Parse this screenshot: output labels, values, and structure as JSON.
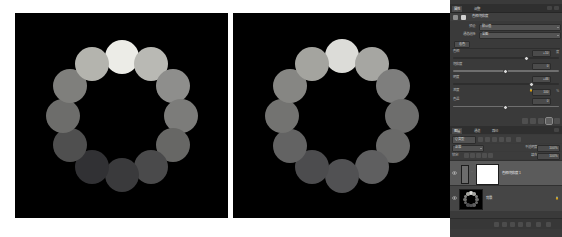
{
  "document": {
    "title": "Hue/Saturation grayscale comparison",
    "canvas_count": 2
  },
  "images": [
    {
      "name": "before-image",
      "background": "#000000",
      "description": "Twelve-disc colour ring rendered in greyscale, high tonal contrast",
      "dots": [
        {
          "index": 1,
          "angle_deg": 270,
          "gray": "#ecece7"
        },
        {
          "index": 2,
          "angle_deg": 300,
          "gray": "#b9b9b4"
        },
        {
          "index": 3,
          "angle_deg": 330,
          "gray": "#8e8e8c"
        },
        {
          "index": 4,
          "angle_deg": 0,
          "gray": "#7c7c7a"
        },
        {
          "index": 5,
          "angle_deg": 30,
          "gray": "#676765"
        },
        {
          "index": 6,
          "angle_deg": 60,
          "gray": "#4a4a4b"
        },
        {
          "index": 7,
          "angle_deg": 90,
          "gray": "#3a3a3c"
        },
        {
          "index": 8,
          "angle_deg": 120,
          "gray": "#313134"
        },
        {
          "index": 9,
          "angle_deg": 150,
          "gray": "#4f4f4f"
        },
        {
          "index": 10,
          "angle_deg": 180,
          "gray": "#6d6d6b"
        },
        {
          "index": 11,
          "angle_deg": 210,
          "gray": "#7f7f7c"
        },
        {
          "index": 12,
          "angle_deg": 240,
          "gray": "#b4b4ae"
        }
      ]
    },
    {
      "name": "after-image",
      "background": "#000000",
      "description": "Same twelve-disc ring after adjustment, tones compressed toward mid grey",
      "dots": [
        {
          "index": 1,
          "angle_deg": 270,
          "gray": "#dcdcd8"
        },
        {
          "index": 2,
          "angle_deg": 300,
          "gray": "#a6a6a2"
        },
        {
          "index": 3,
          "angle_deg": 330,
          "gray": "#7e7e7d"
        },
        {
          "index": 4,
          "angle_deg": 0,
          "gray": "#6e6e6d"
        },
        {
          "index": 5,
          "angle_deg": 30,
          "gray": "#6a6a69"
        },
        {
          "index": 6,
          "angle_deg": 60,
          "gray": "#5f5f60"
        },
        {
          "index": 7,
          "angle_deg": 90,
          "gray": "#515153"
        },
        {
          "index": 8,
          "angle_deg": 120,
          "gray": "#4c4c4e"
        },
        {
          "index": 9,
          "angle_deg": 150,
          "gray": "#636363"
        },
        {
          "index": 10,
          "angle_deg": 180,
          "gray": "#737371"
        },
        {
          "index": 11,
          "angle_deg": 210,
          "gray": "#868683"
        },
        {
          "index": 12,
          "angle_deg": 240,
          "gray": "#a4a49f"
        }
      ]
    }
  ],
  "panel": {
    "tabs": [
      {
        "label": "属性",
        "active": true
      },
      {
        "label": "调整",
        "active": false
      }
    ],
    "adjustment": {
      "title": "色相/饱和度",
      "preset_label": "预设:",
      "preset_value": "默认值",
      "channel_label": "通道选择:",
      "channel_value": "全图",
      "group_button": "着色",
      "sliders": [
        {
          "name": "色相",
          "value": "+10",
          "unit": "度",
          "position_pct": 68
        },
        {
          "name": "饱和度",
          "value": "0",
          "unit": "",
          "position_pct": 50
        },
        {
          "name": "明度",
          "value": "+46",
          "unit": "",
          "position_pct": 73
        },
        {
          "name": "浓度",
          "value": "100",
          "unit": "%",
          "position_pct": 100,
          "locked": true
        },
        {
          "name": "色温",
          "value": "0",
          "unit": "",
          "position_pct": 50
        }
      ]
    },
    "dock_icons": [
      "histogram-icon",
      "info-icon",
      "color-icon",
      "swatches-icon",
      "styles-icon"
    ],
    "layers": {
      "tabs": [
        {
          "label": "图层",
          "active": true
        },
        {
          "label": "通道",
          "active": false
        },
        {
          "label": "路径",
          "active": false
        }
      ],
      "filter_label": "Q 类型",
      "blend_mode": "正常",
      "opacity_label": "不透明度:",
      "opacity_value": "100%",
      "lock_label": "锁定:",
      "fill_label": "填充:",
      "fill_value": "100%",
      "items": [
        {
          "name": "色相/饱和度 1",
          "type": "adjustment-layer",
          "thumb": "white",
          "selected": true,
          "visible": true
        },
        {
          "name": "背景",
          "type": "image-layer",
          "thumb": "ring",
          "selected": false,
          "visible": true,
          "locked": true
        }
      ],
      "footer_icons": [
        "link-layers-icon",
        "layer-style-icon",
        "add-mask-icon",
        "new-adjustment-icon",
        "new-group-icon",
        "new-layer-icon",
        "delete-layer-icon"
      ]
    }
  }
}
